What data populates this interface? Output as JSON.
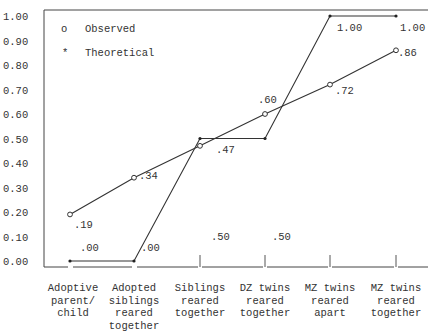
{
  "chart_data": {
    "type": "line",
    "title": "",
    "xlabel": "",
    "ylabel": "",
    "ylim": [
      0.0,
      1.0
    ],
    "grid": false,
    "legend_position": "upper-left",
    "y_ticks": [
      "1.00",
      "0.90",
      "0.80",
      "0.70",
      "0.60",
      "0.50",
      "0.40",
      "0.30",
      "0.20",
      "0.10",
      "0.00"
    ],
    "categories": [
      "Adoptive parent/ child",
      "Adopted siblings reared together",
      "Siblings reared together",
      "DZ twins reared together",
      "MZ twins reared apart",
      "MZ twins reared together"
    ],
    "category_lines": [
      [
        "Adoptive",
        "parent/",
        "child"
      ],
      [
        "Adopted",
        "siblings",
        "reared",
        "together"
      ],
      [
        "Siblings",
        "reared",
        "together"
      ],
      [
        "DZ twins",
        "reared",
        "together"
      ],
      [
        "MZ twins",
        "reared",
        "apart"
      ],
      [
        "MZ twins",
        "reared",
        "together"
      ]
    ],
    "series": [
      {
        "name": "Observed",
        "marker": "o",
        "values": [
          0.19,
          0.34,
          0.47,
          0.6,
          0.72,
          0.86
        ],
        "labels": [
          ".19",
          ".34",
          ".47",
          ".60",
          ".72",
          ".86"
        ]
      },
      {
        "name": "Theoretical",
        "marker": "*",
        "values": [
          0.0,
          0.0,
          0.5,
          0.5,
          1.0,
          1.0
        ],
        "labels": [
          ".00",
          ".00",
          ".50",
          ".50",
          "1.00",
          "1.00"
        ]
      }
    ]
  },
  "legend": {
    "observed_symbol": "o",
    "observed_label": "Observed",
    "theoretical_symbol": "*",
    "theoretical_label": "Theoretical"
  }
}
